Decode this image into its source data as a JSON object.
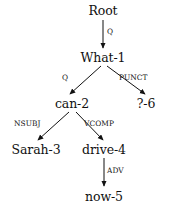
{
  "diagram": {
    "type": "dependency-parse-tree",
    "background_color": "#ffffff",
    "ink_color": "#111111",
    "sentence_tokens": [
      "What-1",
      "can-2",
      "Sarah-3",
      "drive-4",
      "now-5",
      "?-6"
    ],
    "nodes": [
      {
        "id": "root",
        "label": "Root",
        "x": 103,
        "y": 4
      },
      {
        "id": "what1",
        "label": "What-1",
        "x": 103,
        "y": 51
      },
      {
        "id": "can2",
        "label": "can-2",
        "x": 72,
        "y": 97
      },
      {
        "id": "q6",
        "label": "?-6",
        "x": 146,
        "y": 97
      },
      {
        "id": "sarah3",
        "label": "Sarah-3",
        "x": 36,
        "y": 143
      },
      {
        "id": "drive4",
        "label": "drive-4",
        "x": 104,
        "y": 143
      },
      {
        "id": "now5",
        "label": "now-5",
        "x": 104,
        "y": 190
      }
    ],
    "edges": [
      {
        "from": "root",
        "to": "what1",
        "label": "Q",
        "label_x": 107,
        "label_y": 28,
        "x1": 103,
        "y1": 20,
        "x2": 103,
        "y2": 48
      },
      {
        "from": "what1",
        "to": "can2",
        "label": "Q",
        "label_x": 62,
        "label_y": 74,
        "x1": 101,
        "y1": 66,
        "x2": 70,
        "y2": 94
      },
      {
        "from": "what1",
        "to": "q6",
        "label": "PUNCT",
        "label_x": 119,
        "label_y": 74,
        "x1": 107,
        "y1": 66,
        "x2": 145,
        "y2": 94
      },
      {
        "from": "can2",
        "to": "sarah3",
        "label": "NSUBJ",
        "label_x": 14,
        "label_y": 120,
        "x1": 69,
        "y1": 112,
        "x2": 38,
        "y2": 140
      },
      {
        "from": "can2",
        "to": "drive4",
        "label": "VCOMP",
        "label_x": 84,
        "label_y": 120,
        "x1": 76,
        "y1": 112,
        "x2": 103,
        "y2": 140
      },
      {
        "from": "drive4",
        "to": "now5",
        "label": "ADV",
        "label_x": 107,
        "label_y": 167,
        "x1": 104,
        "y1": 158,
        "x2": 104,
        "y2": 186
      }
    ]
  }
}
